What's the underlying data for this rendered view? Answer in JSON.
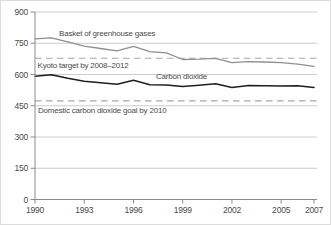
{
  "chart_data": {
    "type": "line",
    "title": "",
    "xlabel": "",
    "ylabel": "",
    "xlim": [
      1990,
      2007
    ],
    "ylim": [
      0,
      900
    ],
    "grid": "horizontal",
    "legend_position": "inline-annotations",
    "x": [
      1990,
      1991,
      1992,
      1993,
      1994,
      1995,
      1996,
      1997,
      1998,
      1999,
      2000,
      2001,
      2002,
      2003,
      2004,
      2005,
      2006,
      2007
    ],
    "x_tick_labels": [
      "1990",
      "1993",
      "1996",
      "1999",
      "2002",
      "2005",
      "2007"
    ],
    "x_tick_years": [
      1990,
      1993,
      1996,
      1999,
      2002,
      2005,
      2007
    ],
    "y_ticks": [
      0,
      150,
      300,
      450,
      600,
      750,
      900
    ],
    "y_tick_labels": [
      "0",
      "150",
      "300",
      "450",
      "600",
      "750",
      "900"
    ],
    "series": [
      {
        "name": "Basket of greenhouse gases",
        "color": "#8f8f8f",
        "width": 1.3,
        "values": [
          771,
          776,
          757,
          736,
          725,
          714,
          735,
          710,
          704,
          672,
          674,
          678,
          657,
          662,
          660,
          657,
          650,
          639
        ]
      },
      {
        "name": "Carbon dioxide",
        "color": "#1f1f1f",
        "width": 1.5,
        "values": [
          592,
          599,
          582,
          568,
          560,
          553,
          572,
          551,
          550,
          542,
          548,
          556,
          538,
          547,
          546,
          545,
          546,
          538
        ]
      }
    ],
    "reference_lines": [
      {
        "name": "Kyoto target by 2008–2012",
        "value": 678,
        "style": "dashed",
        "color": "#a8a8a8"
      },
      {
        "name": "Domestic carbon dioxide goal by 2010",
        "value": 473,
        "style": "dashed",
        "color": "#a8a8a8"
      }
    ]
  },
  "colors": {
    "background": "#ffffff",
    "gridline": "#cccccc",
    "axis": "#8c8c8c",
    "text": "#4a4a4a",
    "frame_border": "#dcdcdc"
  }
}
